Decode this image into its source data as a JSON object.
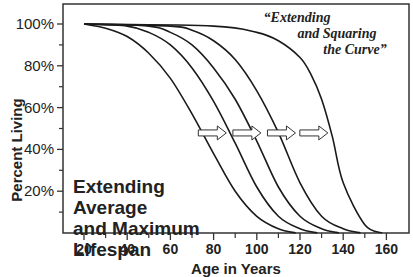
{
  "chart_data": {
    "type": "line",
    "title": "",
    "xlabel": "Age in Years",
    "ylabel": "Percent Living",
    "xlim": [
      10,
      170
    ],
    "ylim": [
      0,
      110
    ],
    "x_ticks": [
      20,
      40,
      60,
      80,
      100,
      120,
      140,
      160
    ],
    "x_minor_ticks": [
      30,
      50,
      70,
      90,
      110,
      130,
      150
    ],
    "y_ticks": [
      20,
      40,
      60,
      80,
      100
    ],
    "y_tick_labels": [
      "20%",
      "40%",
      "60%",
      "80%",
      "100%"
    ],
    "y_minor_ticks": [
      10,
      30,
      50,
      70,
      90
    ],
    "grid": false,
    "legend": null,
    "series": [
      {
        "name": "Curve 1",
        "x": [
          20,
          30,
          40,
          50,
          60,
          70,
          80,
          90,
          100,
          110,
          118
        ],
        "y": [
          100,
          98,
          94,
          86,
          74,
          57,
          38,
          20,
          8,
          2,
          0
        ]
      },
      {
        "name": "Curve 2",
        "x": [
          20,
          40,
          50,
          60,
          70,
          80,
          90,
          100,
          110,
          120,
          128
        ],
        "y": [
          100,
          99,
          96,
          90,
          79,
          63,
          43,
          22,
          8,
          2,
          0
        ]
      },
      {
        "name": "Curve 3",
        "x": [
          20,
          50,
          60,
          70,
          80,
          90,
          100,
          110,
          120,
          130,
          138
        ],
        "y": [
          100,
          99,
          96,
          90,
          79,
          64,
          44,
          22,
          8,
          2,
          0
        ]
      },
      {
        "name": "Curve 4",
        "x": [
          20,
          60,
          70,
          80,
          90,
          100,
          110,
          120,
          130,
          140,
          148
        ],
        "y": [
          100,
          99,
          97,
          92,
          83,
          68,
          48,
          24,
          8,
          2,
          0
        ]
      },
      {
        "name": "Curve 5",
        "x": [
          20,
          80,
          100,
          110,
          120,
          125,
          130,
          135,
          140,
          150,
          158
        ],
        "y": [
          100,
          99,
          96,
          92,
          84,
          76,
          64,
          46,
          24,
          4,
          0
        ]
      }
    ],
    "annotations": [
      {
        "text": "Extending Average and Maximum Lifespan",
        "lines": [
          "Extending",
          "Average",
          "and Maximum",
          "Lifespan"
        ],
        "position": "lower-left"
      },
      {
        "text": "“Extending and Squaring the Curve”",
        "lines": [
          "“Extending",
          "and Squaring",
          "the Curve”"
        ],
        "position": "upper-right"
      },
      {
        "type": "arrows",
        "count": 4,
        "direction": "right",
        "y": 45,
        "x_positions": [
          72,
          88,
          104,
          119
        ]
      }
    ]
  },
  "labels": {
    "xlabel": "Age in Years",
    "ylabel": "Percent Living",
    "left_note": [
      "Extending",
      "Average",
      "and Maximum",
      "Lifespan"
    ],
    "quote": [
      "“Extending",
      "and Squaring",
      "the Curve”"
    ]
  }
}
